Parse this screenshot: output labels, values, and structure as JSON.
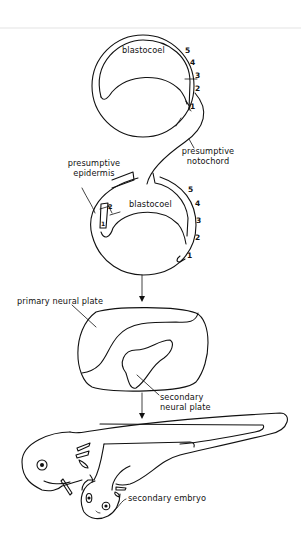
{
  "diagram": {
    "stages": [
      {
        "name": "donor-gastrula",
        "labels": {
          "cavity": "blastocoel",
          "numbers": [
            "5",
            "4",
            "3",
            "2",
            "1"
          ]
        }
      },
      {
        "name": "host-gastrula",
        "labels": {
          "cavity": "blastocoel",
          "numbers": [
            "5",
            "4",
            "3",
            "2",
            "1"
          ],
          "graft_numbers": [
            "2",
            "1"
          ]
        }
      },
      {
        "name": "neurula",
        "labels": {
          "primary": "primary neural plate",
          "secondary_line1": "secondary",
          "secondary_line2": "neural plate"
        }
      },
      {
        "name": "tailbud-embryo",
        "labels": {
          "secondary": "secondary embryo"
        }
      }
    ],
    "connector_labels": {
      "notochord_line1": "presumptive",
      "notochord_line2": "notochord",
      "epidermis_line1": "presumptive",
      "epidermis_line2": "epidermis"
    },
    "colors": {
      "ink": "#111111",
      "background": "#ffffff"
    }
  }
}
